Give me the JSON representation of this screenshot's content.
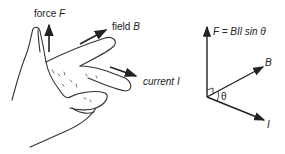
{
  "hand": {
    "force_label": "force ",
    "force_symbol": "F",
    "field_label": "field ",
    "field_symbol": "B",
    "current_label": "current ",
    "current_symbol": "I"
  },
  "vectors": {
    "equation": "F = BIl sin θ",
    "b_label": "B",
    "i_label": "I",
    "angle_label": "θ"
  },
  "colors": {
    "line": "#222222",
    "hand_stroke": "#333333"
  }
}
